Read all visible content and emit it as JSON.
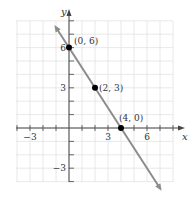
{
  "chart_data": {
    "type": "line",
    "title": "",
    "xlabel": "x",
    "ylabel": "y",
    "xlim": [
      -4,
      8
    ],
    "ylim": [
      -4,
      8
    ],
    "grid": true,
    "x_ticks": [
      -3,
      3,
      6
    ],
    "y_ticks": [
      6,
      3,
      -3
    ],
    "x_tick_labels": [
      "−3",
      "3",
      "6"
    ],
    "y_tick_labels": [
      "6",
      "3",
      "−3"
    ],
    "series": [
      {
        "name": "line",
        "equation": "y = -1.5x + 6",
        "x": [
          -1,
          7
        ],
        "y": [
          7.5,
          -4.5
        ],
        "color": "#8c8c8c",
        "arrows": "both"
      }
    ],
    "points": [
      {
        "x": 0,
        "y": 6,
        "label": "(0, 6)"
      },
      {
        "x": 2,
        "y": 3,
        "label": "(2, 3)"
      },
      {
        "x": 4,
        "y": 0,
        "label": "(4, 0)"
      }
    ],
    "colors": {
      "grid": "#e2e2e2",
      "axis": "#444444",
      "line": "#8c8c8c",
      "point": "#000000"
    }
  }
}
